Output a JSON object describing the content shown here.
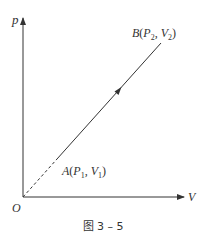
{
  "diagram": {
    "type": "p-V diagram",
    "axes": {
      "y_label": "p",
      "x_label": "V",
      "origin_label": "O"
    },
    "points": {
      "A": {
        "name": "A",
        "p_sub": "1",
        "v_sub": "1",
        "p_sym": "P",
        "v_sym": "V"
      },
      "B": {
        "name": "B",
        "p_sub": "2",
        "v_sub": "2",
        "p_sym": "P",
        "v_sym": "V"
      }
    },
    "process": {
      "from": "A",
      "to": "B",
      "extension_to_origin": "dashed",
      "direction_arrow": "A to B"
    },
    "caption": "图 3 – 5",
    "colors": {
      "line": "#333333",
      "text": "#333333",
      "background": "#ffffff"
    }
  }
}
